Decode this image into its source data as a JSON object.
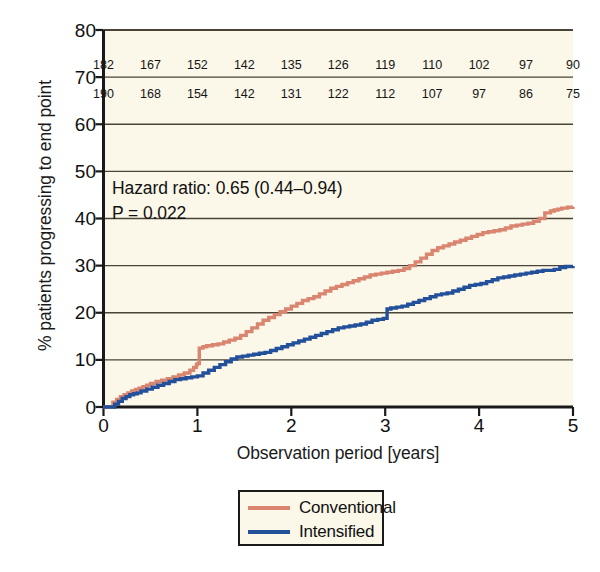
{
  "chart_data": {
    "type": "line",
    "subtype": "kaplan-meier-step",
    "title": "",
    "xlabel": "Observation period [years]",
    "ylabel": "% patients progressing to end point",
    "xlim": [
      0,
      5
    ],
    "ylim": [
      0,
      80
    ],
    "xticks": [
      0,
      1,
      2,
      3,
      4,
      5
    ],
    "xtick_labels": [
      "0",
      "1",
      "2",
      "3",
      "4",
      "5"
    ],
    "yticks": [
      0,
      10,
      20,
      30,
      40,
      50,
      60,
      70,
      80
    ],
    "ytick_labels": [
      "0",
      "10",
      "20",
      "30",
      "40",
      "50",
      "60",
      "70",
      "80"
    ],
    "grid": "horizontal",
    "legend_position": "below-plot",
    "plot_background": "#fbf7e9",
    "annotations": [
      "Hazard ratio: 0.65 (0.44–0.94)",
      "P = 0.022"
    ],
    "series": [
      {
        "name": "Conventional",
        "color": "#d98570",
        "x": [
          0.0,
          0.1,
          0.14,
          0.18,
          0.22,
          0.26,
          0.3,
          0.34,
          0.38,
          0.42,
          0.46,
          0.5,
          0.56,
          0.62,
          0.68,
          0.74,
          0.8,
          0.86,
          0.92,
          0.96,
          0.99,
          1.0,
          1.02,
          1.06,
          1.1,
          1.16,
          1.22,
          1.28,
          1.34,
          1.4,
          1.46,
          1.52,
          1.58,
          1.64,
          1.7,
          1.76,
          1.82,
          1.88,
          1.94,
          2.0,
          2.06,
          2.12,
          2.18,
          2.24,
          2.3,
          2.36,
          2.42,
          2.48,
          2.54,
          2.6,
          2.66,
          2.72,
          2.78,
          2.84,
          2.9,
          2.96,
          3.02,
          3.08,
          3.14,
          3.2,
          3.26,
          3.32,
          3.38,
          3.44,
          3.5,
          3.56,
          3.62,
          3.68,
          3.74,
          3.8,
          3.86,
          3.92,
          3.98,
          4.04,
          4.1,
          4.16,
          4.22,
          4.28,
          4.34,
          4.4,
          4.46,
          4.52,
          4.58,
          4.64,
          4.7,
          4.76,
          4.8,
          4.84,
          4.88,
          4.94,
          5.0
        ],
        "y": [
          0.0,
          1.0,
          1.6,
          2.2,
          2.6,
          3.0,
          3.4,
          3.7,
          4.0,
          4.3,
          4.6,
          5.0,
          5.4,
          5.7,
          6.0,
          6.4,
          6.8,
          7.2,
          7.8,
          8.4,
          9.0,
          9.2,
          12.5,
          12.8,
          13.0,
          13.2,
          13.4,
          13.8,
          14.2,
          14.6,
          15.2,
          16.0,
          16.8,
          17.6,
          18.4,
          19.0,
          19.6,
          20.2,
          20.8,
          21.4,
          22.0,
          22.6,
          23.0,
          23.4,
          24.0,
          24.6,
          25.2,
          25.6,
          26.0,
          26.4,
          26.8,
          27.2,
          27.6,
          28.0,
          28.2,
          28.4,
          28.6,
          28.8,
          29.0,
          29.4,
          30.0,
          30.8,
          31.6,
          32.4,
          33.2,
          33.8,
          34.2,
          34.6,
          35.0,
          35.4,
          35.8,
          36.2,
          36.6,
          37.0,
          37.2,
          37.4,
          37.6,
          38.0,
          38.4,
          38.6,
          38.8,
          39.0,
          39.4,
          40.0,
          41.2,
          41.6,
          41.8,
          42.0,
          42.2,
          42.4,
          42.5
        ],
        "final_value": 42.5
      },
      {
        "name": "Intensified",
        "color": "#23509a",
        "x": [
          0.0,
          0.12,
          0.16,
          0.2,
          0.24,
          0.28,
          0.32,
          0.36,
          0.4,
          0.46,
          0.52,
          0.58,
          0.64,
          0.7,
          0.76,
          0.82,
          0.88,
          0.94,
          1.0,
          1.06,
          1.12,
          1.18,
          1.24,
          1.3,
          1.36,
          1.42,
          1.48,
          1.54,
          1.6,
          1.66,
          1.72,
          1.78,
          1.84,
          1.9,
          1.96,
          2.02,
          2.08,
          2.14,
          2.2,
          2.26,
          2.32,
          2.38,
          2.44,
          2.5,
          2.56,
          2.62,
          2.68,
          2.74,
          2.8,
          2.86,
          2.92,
          2.98,
          3.02,
          3.06,
          3.12,
          3.18,
          3.24,
          3.3,
          3.36,
          3.42,
          3.48,
          3.54,
          3.6,
          3.66,
          3.72,
          3.78,
          3.84,
          3.9,
          3.96,
          4.02,
          4.08,
          4.14,
          4.2,
          4.26,
          4.32,
          4.38,
          4.44,
          4.5,
          4.56,
          4.62,
          4.68,
          4.74,
          4.8,
          4.86,
          4.92,
          5.0
        ],
        "y": [
          0.0,
          0.6,
          1.2,
          1.8,
          2.2,
          2.6,
          2.8,
          3.0,
          3.4,
          3.8,
          4.2,
          4.6,
          5.0,
          5.4,
          5.8,
          6.0,
          6.2,
          6.4,
          6.6,
          7.2,
          7.8,
          8.4,
          9.0,
          9.6,
          10.2,
          10.6,
          10.8,
          11.0,
          11.2,
          11.4,
          11.6,
          12.0,
          12.4,
          12.8,
          13.2,
          13.6,
          14.0,
          14.4,
          14.8,
          15.2,
          15.6,
          16.0,
          16.4,
          16.8,
          17.0,
          17.2,
          17.4,
          17.6,
          18.0,
          18.4,
          18.6,
          18.8,
          20.8,
          21.0,
          21.2,
          21.4,
          21.8,
          22.2,
          22.6,
          23.0,
          23.4,
          23.8,
          24.0,
          24.2,
          24.6,
          25.0,
          25.4,
          25.8,
          26.0,
          26.2,
          26.6,
          27.0,
          27.4,
          27.6,
          27.8,
          28.0,
          28.2,
          28.4,
          28.6,
          28.8,
          29.0,
          29.0,
          29.2,
          29.6,
          29.8,
          29.9
        ],
        "final_value": 29.9
      }
    ],
    "risk_table": {
      "x_positions": [
        0,
        0.5,
        1,
        1.5,
        2,
        2.5,
        3,
        3.5,
        4,
        4.5,
        5
      ],
      "rows": [
        {
          "series": "Conventional",
          "values": [
            182,
            167,
            152,
            142,
            135,
            126,
            119,
            110,
            102,
            97,
            90
          ]
        },
        {
          "series": "Intensified",
          "values": [
            190,
            168,
            154,
            142,
            131,
            122,
            112,
            107,
            97,
            86,
            75
          ]
        }
      ]
    }
  },
  "legend": {
    "items": [
      {
        "label": "Conventional",
        "color": "#d98570"
      },
      {
        "label": "Intensified",
        "color": "#23509a"
      }
    ]
  },
  "colors": {
    "conventional": "#d98570",
    "intensified": "#23509a",
    "plot_background": "#fbf7e9",
    "axis": "#1a1a1a",
    "gridline": "#4a4438",
    "text": "#111111"
  }
}
